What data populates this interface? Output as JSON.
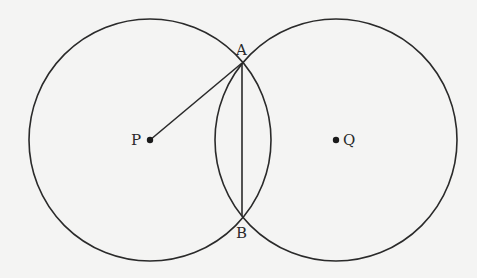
{
  "diagram": {
    "background": "#f4f4f3",
    "stroke_color": "#2a2a2a",
    "circles": [
      {
        "name": "circle-p",
        "cx": 150,
        "cy": 140,
        "r": 121
      },
      {
        "name": "circle-q",
        "cx": 336,
        "cy": 140,
        "r": 121
      }
    ],
    "points": {
      "P": {
        "label": "P",
        "x": 150,
        "y": 140
      },
      "Q": {
        "label": "Q",
        "x": 336,
        "y": 140
      },
      "A": {
        "label": "A",
        "x": 242,
        "y": 63
      },
      "B": {
        "label": "B",
        "x": 242,
        "y": 216
      }
    },
    "segments": [
      {
        "name": "segment-pa",
        "from": "P",
        "to": "A"
      },
      {
        "name": "segment-ab",
        "from": "A",
        "to": "B"
      }
    ]
  }
}
